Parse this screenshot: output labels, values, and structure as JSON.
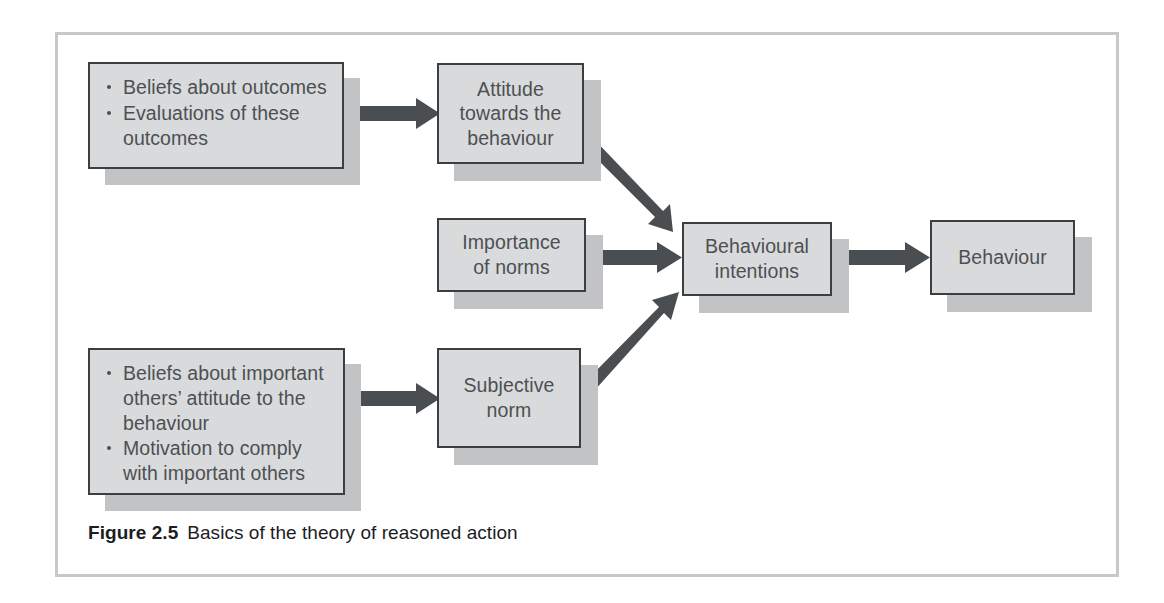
{
  "figure": {
    "caption_number": "Figure 2.5",
    "caption_text": "Basics of the theory of reasoned action"
  },
  "colors": {
    "box_fill": "#d9dadb",
    "box_border": "#3b3f42",
    "box_shadow": "#c2c3c4",
    "arrow": "#4a4e51",
    "frame": "#c6c8ca",
    "text": "#4c5053",
    "caption_text": "#1c1d1f"
  },
  "nodes": {
    "beliefs_outcomes": {
      "name": "beliefs-about-outcomes-box",
      "bullets": [
        "Beliefs about outcomes",
        "Evaluations of these outcomes"
      ]
    },
    "attitude": {
      "name": "attitude-towards-behaviour-box",
      "label": "Attitude\ntowards the\nbehaviour"
    },
    "importance_norms": {
      "name": "importance-of-norms-box",
      "label": "Importance\nof norms"
    },
    "behavioural_intentions": {
      "name": "behavioural-intentions-box",
      "label": "Behavioural\nintentions"
    },
    "behaviour": {
      "name": "behaviour-box",
      "label": "Behaviour"
    },
    "beliefs_others": {
      "name": "beliefs-about-important-others-box",
      "bullets": [
        "Beliefs about important others’ attitude to the behaviour",
        "Motivation to comply with important others"
      ]
    },
    "subjective_norm": {
      "name": "subjective-norm-box",
      "label": "Subjective\nnorm"
    }
  },
  "edges": [
    {
      "id": "e1",
      "from": "beliefs_outcomes",
      "to": "attitude",
      "direction": "right"
    },
    {
      "id": "e2",
      "from": "attitude",
      "to": "behavioural_intentions",
      "direction": "diagonal-down-right"
    },
    {
      "id": "e3",
      "from": "importance_norms",
      "to": "behavioural_intentions",
      "direction": "right"
    },
    {
      "id": "e4",
      "from": "beliefs_others",
      "to": "subjective_norm",
      "direction": "right"
    },
    {
      "id": "e5",
      "from": "subjective_norm",
      "to": "behavioural_intentions",
      "direction": "diagonal-up-right"
    },
    {
      "id": "e6",
      "from": "behavioural_intentions",
      "to": "behaviour",
      "direction": "right"
    }
  ]
}
